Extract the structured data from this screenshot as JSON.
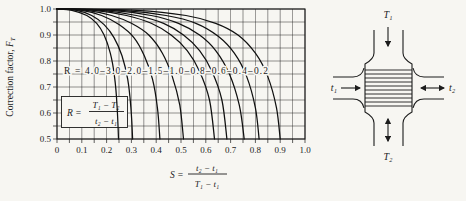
{
  "figure": {
    "background": "#f7f6f2",
    "ink": "#1c1c1c"
  },
  "chart_data": {
    "type": "line",
    "title": "",
    "ylabel": {
      "prefix": "Correction factor, ",
      "symbol": "F",
      "sub": "T"
    },
    "x_axis_formula": {
      "symbol": "S",
      "eq": "=",
      "numerator": "t₂ − t₁",
      "denominator": "T₁ − t₁"
    },
    "r_definition": {
      "symbol": "R",
      "eq": "=",
      "numerator": "T₁ − T₂",
      "denominator": "t₂ − t₁"
    },
    "xlim": [
      0,
      1.0
    ],
    "ylim": [
      0.5,
      1.0
    ],
    "grid_step": 0.05,
    "grid": true,
    "x_ticks": [
      "0",
      "0.1",
      "0.2",
      "0.3",
      "0.4",
      "0.5",
      "0.6",
      "0.7",
      "0.8",
      "0.9",
      "1.0"
    ],
    "y_ticks": [
      "1.0",
      "0.9",
      "0.8",
      "0.7",
      "0.6",
      "0.5"
    ],
    "curve_label_prefix": "R = ",
    "curve_label_separator": "–",
    "series": [
      {
        "name": "4.0",
        "points": [
          [
            0,
            1.0
          ],
          [
            0.06,
            0.995
          ],
          [
            0.12,
            0.975
          ],
          [
            0.16,
            0.945
          ],
          [
            0.19,
            0.9
          ],
          [
            0.215,
            0.83
          ],
          [
            0.232,
            0.74
          ],
          [
            0.242,
            0.63
          ],
          [
            0.248,
            0.5
          ]
        ]
      },
      {
        "name": "3.0",
        "points": [
          [
            0,
            1.0
          ],
          [
            0.08,
            0.995
          ],
          [
            0.14,
            0.975
          ],
          [
            0.19,
            0.94
          ],
          [
            0.23,
            0.89
          ],
          [
            0.262,
            0.82
          ],
          [
            0.285,
            0.73
          ],
          [
            0.298,
            0.62
          ],
          [
            0.305,
            0.5
          ]
        ]
      },
      {
        "name": "2.0",
        "points": [
          [
            0,
            1.0
          ],
          [
            0.1,
            0.995
          ],
          [
            0.18,
            0.975
          ],
          [
            0.25,
            0.94
          ],
          [
            0.31,
            0.89
          ],
          [
            0.352,
            0.82
          ],
          [
            0.385,
            0.73
          ],
          [
            0.405,
            0.62
          ],
          [
            0.415,
            0.5
          ]
        ]
      },
      {
        "name": "1.5",
        "points": [
          [
            0,
            1.0
          ],
          [
            0.12,
            0.995
          ],
          [
            0.22,
            0.975
          ],
          [
            0.3,
            0.945
          ],
          [
            0.37,
            0.9
          ],
          [
            0.425,
            0.83
          ],
          [
            0.465,
            0.74
          ],
          [
            0.495,
            0.63
          ],
          [
            0.51,
            0.5
          ]
        ]
      },
      {
        "name": "1.0",
        "points": [
          [
            0,
            1.0
          ],
          [
            0.15,
            0.995
          ],
          [
            0.28,
            0.975
          ],
          [
            0.38,
            0.945
          ],
          [
            0.46,
            0.9
          ],
          [
            0.525,
            0.84
          ],
          [
            0.575,
            0.76
          ],
          [
            0.615,
            0.65
          ],
          [
            0.635,
            0.5
          ]
        ]
      },
      {
        "name": "0.8",
        "points": [
          [
            0,
            1.0
          ],
          [
            0.18,
            0.995
          ],
          [
            0.32,
            0.975
          ],
          [
            0.43,
            0.945
          ],
          [
            0.51,
            0.9
          ],
          [
            0.575,
            0.84
          ],
          [
            0.625,
            0.76
          ],
          [
            0.665,
            0.65
          ],
          [
            0.685,
            0.5
          ]
        ]
      },
      {
        "name": "0.6",
        "points": [
          [
            0,
            1.0
          ],
          [
            0.22,
            0.995
          ],
          [
            0.38,
            0.975
          ],
          [
            0.49,
            0.945
          ],
          [
            0.575,
            0.9
          ],
          [
            0.64,
            0.84
          ],
          [
            0.695,
            0.75
          ],
          [
            0.735,
            0.63
          ],
          [
            0.755,
            0.5
          ]
        ]
      },
      {
        "name": "0.4",
        "points": [
          [
            0,
            1.0
          ],
          [
            0.26,
            0.995
          ],
          [
            0.44,
            0.975
          ],
          [
            0.56,
            0.945
          ],
          [
            0.65,
            0.895
          ],
          [
            0.715,
            0.83
          ],
          [
            0.765,
            0.74
          ],
          [
            0.8,
            0.62
          ],
          [
            0.815,
            0.5
          ]
        ]
      },
      {
        "name": "0.2",
        "points": [
          [
            0,
            1.0
          ],
          [
            0.32,
            0.995
          ],
          [
            0.52,
            0.975
          ],
          [
            0.64,
            0.945
          ],
          [
            0.73,
            0.9
          ],
          [
            0.8,
            0.83
          ],
          [
            0.85,
            0.74
          ],
          [
            0.885,
            0.62
          ],
          [
            0.9,
            0.5
          ]
        ]
      }
    ]
  },
  "diagram": {
    "top_label": "T₁",
    "bottom_label": "T₂",
    "left_label": "t₁",
    "right_label": "t₂"
  }
}
